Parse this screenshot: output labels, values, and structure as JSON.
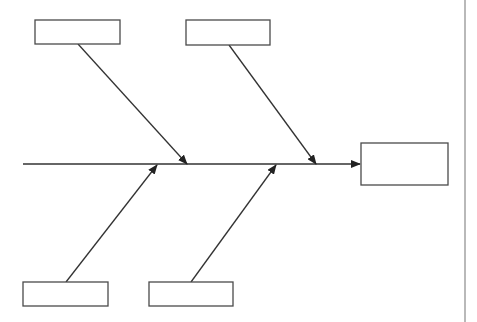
{
  "diagram": {
    "type": "fishbone",
    "colors": {
      "line": "#333333",
      "box_border": "#4a4a4a",
      "background": "#ffffff",
      "separator": "#8a8a8a"
    },
    "spine": {
      "x1": 23,
      "y": 164,
      "x2": 361
    },
    "effect_box": {
      "x": 361,
      "y": 143,
      "w": 87,
      "h": 42,
      "label": ""
    },
    "causes": [
      {
        "id": "top-left",
        "box": {
          "x": 35,
          "y": 20,
          "w": 85,
          "h": 24
        },
        "label": "",
        "line": {
          "x1": 78,
          "y1": 44,
          "x2": 187,
          "y2": 164
        }
      },
      {
        "id": "top-middle",
        "box": {
          "x": 186,
          "y": 20,
          "w": 84,
          "h": 25
        },
        "label": "",
        "line": {
          "x1": 229,
          "y1": 45,
          "x2": 316,
          "y2": 164
        }
      },
      {
        "id": "bottom-left",
        "box": {
          "x": 23,
          "y": 282,
          "w": 85,
          "h": 24
        },
        "label": "",
        "line": {
          "x1": 66,
          "y1": 282,
          "x2": 157,
          "y2": 165
        }
      },
      {
        "id": "bottom-middle",
        "box": {
          "x": 149,
          "y": 282,
          "w": 84,
          "h": 24
        },
        "label": "",
        "line": {
          "x1": 191,
          "y1": 282,
          "x2": 276,
          "y2": 165
        }
      }
    ],
    "separator": {
      "x": 465,
      "y1": 0,
      "y2": 322
    }
  }
}
